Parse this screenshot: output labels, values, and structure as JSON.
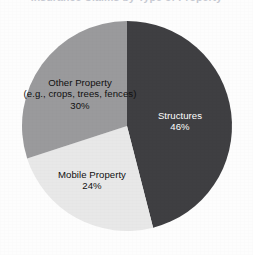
{
  "figure": {
    "title_remnant": "Insurance Claims by Type of Property",
    "background_color": "#fdfdfd",
    "width": 253,
    "height": 255
  },
  "chart_data": {
    "type": "pie",
    "title": "Insurance Claims by Type of Property",
    "xlabel": "",
    "ylabel": "",
    "legend_position": "none",
    "grid": false,
    "start_angle_deg": 0,
    "direction": "clockwise",
    "categories": [
      "Structures",
      "Mobile Property",
      "Other Property (e.g., crops, trees, fences)"
    ],
    "values": [
      46,
      30,
      24
    ],
    "slices": [
      {
        "name": "Structures",
        "label": "Structures",
        "sublabel": "",
        "value": 46,
        "pct_text": "46%",
        "color": "#3f3f42",
        "text_color": "#ffffff",
        "start_deg": 0,
        "end_deg": 165.6
      },
      {
        "name": "Mobile Property",
        "label": "Mobile Property",
        "sublabel": "",
        "value": 24,
        "pct_text": "24%",
        "color": "#e8e8e8",
        "text_color": "#101010",
        "start_deg": 165.6,
        "end_deg": 252.0
      },
      {
        "name": "Other Property",
        "label": "Other Property",
        "sublabel": "(e.g., crops, trees, fences)",
        "value": 30,
        "pct_text": "30%",
        "color": "#9a9a9c",
        "text_color": "#101010",
        "start_deg": 252.0,
        "end_deg": 360.0
      }
    ],
    "geometry": {
      "center_x": 127,
      "center_y": 126,
      "radius": 105
    }
  }
}
